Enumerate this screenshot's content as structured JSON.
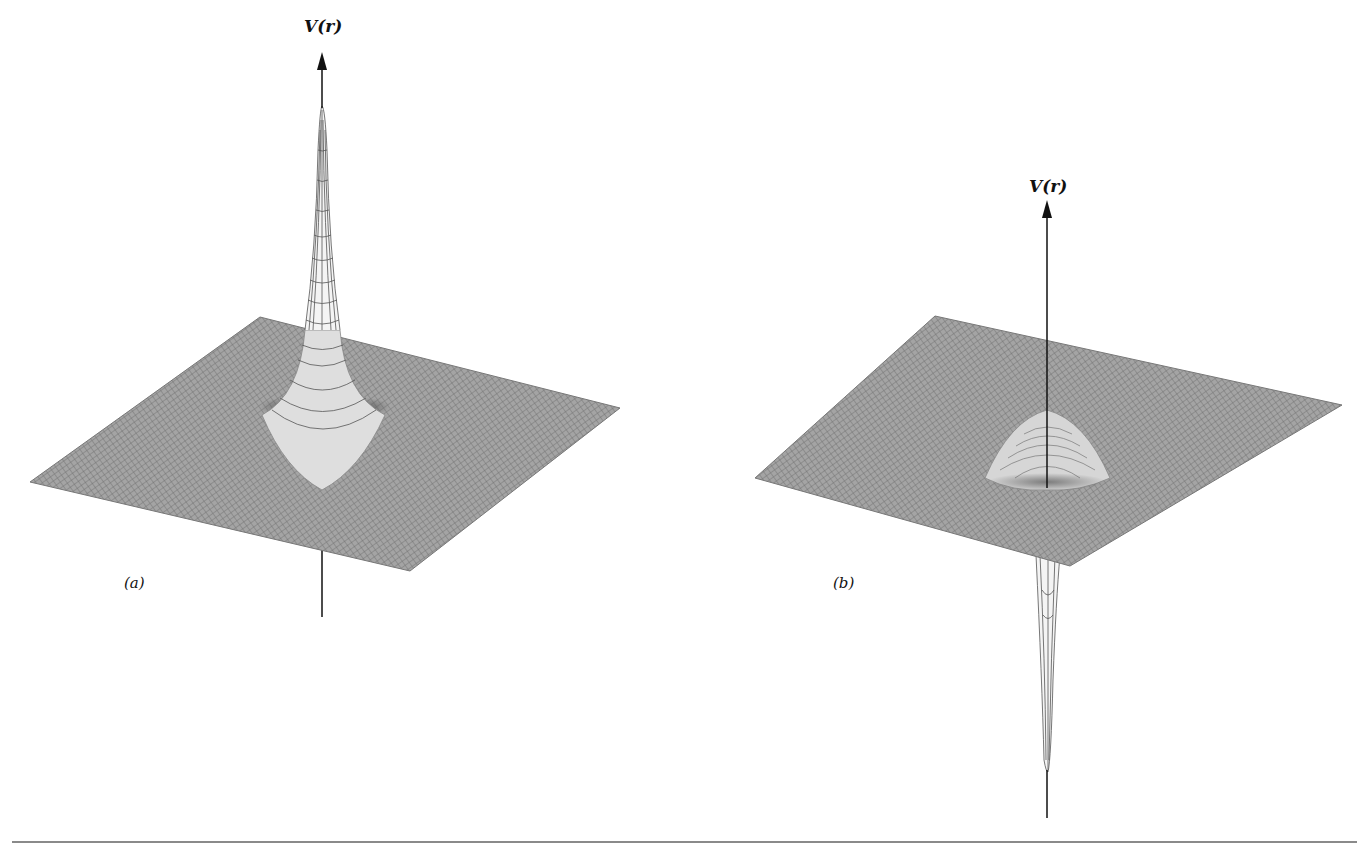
{
  "figure": {
    "panels": [
      {
        "id": "a",
        "panel_label": "(a)",
        "axis_label": "V(r)",
        "description": "Repulsive potential surface: sharp positive spike at origin on a flat wireframe plane",
        "shape": "peak",
        "plane": {
          "left": [
            30,
            482
          ],
          "top": [
            260,
            317
          ],
          "right": [
            620,
            408
          ],
          "bottom": [
            410,
            571
          ]
        },
        "center": [
          322,
          430
        ],
        "spike_tip_y": 108,
        "axis": {
          "x": 322,
          "arrow_top": 55,
          "bottom_end": 617
        }
      },
      {
        "id": "b",
        "panel_label": "(b)",
        "axis_label": "V(r)",
        "description": "Attractive potential surface: sharp negative well at origin below a flat wireframe plane",
        "shape": "well",
        "plane": {
          "left": [
            755,
            478
          ],
          "top": [
            935,
            316
          ],
          "right": [
            1342,
            405
          ],
          "bottom": [
            1070,
            566
          ]
        },
        "center": [
          1047,
          486
        ],
        "spike_tip_y": 772,
        "axis": {
          "x": 1047,
          "arrow_top": 202,
          "bottom_end": 818
        }
      }
    ],
    "colors": {
      "mesh": "#7a7a7a",
      "mesh_fill": "#9c9c9c",
      "axis": "#111111",
      "rule": "#8a8a8a",
      "background": "#ffffff"
    }
  }
}
